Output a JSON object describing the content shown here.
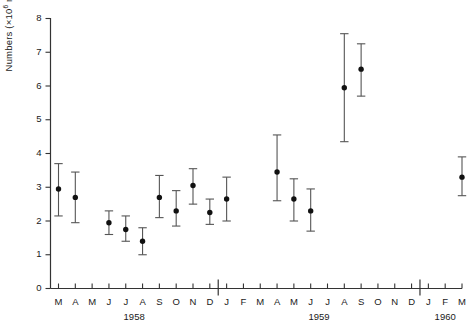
{
  "chart_data": {
    "type": "scatter",
    "title": "",
    "xlabel": "",
    "ylabel": "Numbers (×10⁶ m⁻²)",
    "ylabel_parts": {
      "prefix": "Numbers (×10",
      "exp1": "6",
      "mid": " m",
      "exp2": "−2",
      "suffix": ")"
    },
    "ylim": [
      0,
      8
    ],
    "yticks": [
      0,
      1,
      2,
      3,
      4,
      5,
      6,
      7,
      8
    ],
    "ytick_labels": [
      "0",
      "1",
      "2",
      "3",
      "4",
      "5",
      "6",
      "7",
      "8"
    ],
    "grid": false,
    "legend": "none",
    "error_bars": "symmetric-caps",
    "marker": "filled-circle",
    "categories": [
      "M",
      "A",
      "M",
      "J",
      "J",
      "A",
      "S",
      "O",
      "N",
      "D",
      "J",
      "F",
      "M",
      "A",
      "M",
      "J",
      "J",
      "A",
      "S",
      "O",
      "N",
      "D",
      "J",
      "F",
      "M"
    ],
    "category_months": [
      "Mar 1958",
      "Apr 1958",
      "May 1958",
      "Jun 1958",
      "Jul 1958",
      "Aug 1958",
      "Sep 1958",
      "Oct 1958",
      "Nov 1958",
      "Dec 1958",
      "Jan 1959",
      "Feb 1959",
      "Mar 1959",
      "Apr 1959",
      "May 1959",
      "Jun 1959",
      "Jul 1959",
      "Aug 1959",
      "Sep 1959",
      "Oct 1959",
      "Nov 1959",
      "Dec 1959",
      "Jan 1960",
      "Feb 1960",
      "Mar 1960"
    ],
    "year_groups": [
      {
        "label": "1958",
        "start_index": 0,
        "end_index": 9
      },
      {
        "label": "1959",
        "start_index": 10,
        "end_index": 21
      },
      {
        "label": "1960",
        "start_index": 22,
        "end_index": 24
      }
    ],
    "year_separator_after_index": [
      9,
      21
    ],
    "points": [
      {
        "category": "M",
        "month": "Mar 1958",
        "value": 2.95,
        "low": 2.15,
        "high": 3.7
      },
      {
        "category": "A",
        "month": "Apr 1958",
        "value": 2.7,
        "low": 1.95,
        "high": 3.45
      },
      {
        "category": "M",
        "month": "May 1958",
        "value": null,
        "low": null,
        "high": null
      },
      {
        "category": "J",
        "month": "Jun 1958",
        "value": 1.95,
        "low": 1.6,
        "high": 2.3
      },
      {
        "category": "J",
        "month": "Jul 1958",
        "value": 1.75,
        "low": 1.4,
        "high": 2.15
      },
      {
        "category": "A",
        "month": "Aug 1958",
        "value": 1.4,
        "low": 1.0,
        "high": 1.8
      },
      {
        "category": "S",
        "month": "Sep 1958",
        "value": 2.7,
        "low": 2.1,
        "high": 3.35
      },
      {
        "category": "O",
        "month": "Oct 1958",
        "value": 2.3,
        "low": 1.85,
        "high": 2.9
      },
      {
        "category": "N",
        "month": "Nov 1958",
        "value": 3.05,
        "low": 2.5,
        "high": 3.55
      },
      {
        "category": "D",
        "month": "Dec 1958",
        "value": 2.25,
        "low": 1.9,
        "high": 2.65
      },
      {
        "category": "J",
        "month": "Jan 1959",
        "value": 2.65,
        "low": 2.0,
        "high": 3.3
      },
      {
        "category": "F",
        "month": "Feb 1959",
        "value": null,
        "low": null,
        "high": null
      },
      {
        "category": "M",
        "month": "Mar 1959",
        "value": null,
        "low": null,
        "high": null
      },
      {
        "category": "A",
        "month": "Apr 1959",
        "value": 3.45,
        "low": 2.6,
        "high": 4.55
      },
      {
        "category": "M",
        "month": "May 1959",
        "value": 2.65,
        "low": 2.0,
        "high": 3.25
      },
      {
        "category": "J",
        "month": "Jun 1959",
        "value": 2.3,
        "low": 1.7,
        "high": 2.95
      },
      {
        "category": "J",
        "month": "Jul 1959",
        "value": null,
        "low": null,
        "high": null
      },
      {
        "category": "A",
        "month": "Aug 1959",
        "value": 5.95,
        "low": 4.35,
        "high": 7.55
      },
      {
        "category": "S",
        "month": "Sep 1959",
        "value": 6.5,
        "low": 5.7,
        "high": 7.25
      },
      {
        "category": "O",
        "month": "Oct 1959",
        "value": null,
        "low": null,
        "high": null
      },
      {
        "category": "N",
        "month": "Nov 1959",
        "value": null,
        "low": null,
        "high": null
      },
      {
        "category": "D",
        "month": "Dec 1959",
        "value": null,
        "low": null,
        "high": null
      },
      {
        "category": "J",
        "month": "Jan 1960",
        "value": null,
        "low": null,
        "high": null
      },
      {
        "category": "F",
        "month": "Feb 1960",
        "value": null,
        "low": null,
        "high": null
      },
      {
        "category": "M",
        "month": "Mar 1960",
        "value": 3.3,
        "low": 2.75,
        "high": 3.9
      }
    ]
  }
}
